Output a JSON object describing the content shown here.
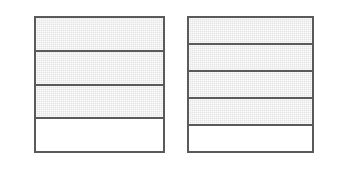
{
  "figure": {
    "background_color": "#ffffff",
    "border_color": "#5a5a5a",
    "shaded_color": "#e4e4e4",
    "unshaded_color": "#ffffff"
  },
  "models": [
    {
      "name": "left-fraction-model",
      "label": "3/4",
      "numerator": 3,
      "denominator": 4,
      "total_parts": 4,
      "shaded_parts": 3,
      "unshaded_parts": 1,
      "orientation": "horizontal-bands",
      "x": 34,
      "y": 16,
      "width": 131,
      "height": 137,
      "bands": [
        {
          "index": 1,
          "state": "shaded"
        },
        {
          "index": 2,
          "state": "shaded"
        },
        {
          "index": 3,
          "state": "shaded"
        },
        {
          "index": 4,
          "state": "unshaded"
        }
      ]
    },
    {
      "name": "right-fraction-model",
      "label": "4/5",
      "numerator": 4,
      "denominator": 5,
      "total_parts": 5,
      "shaded_parts": 4,
      "unshaded_parts": 1,
      "orientation": "horizontal-bands",
      "x": 187,
      "y": 16,
      "width": 127,
      "height": 137,
      "bands": [
        {
          "index": 1,
          "state": "shaded"
        },
        {
          "index": 2,
          "state": "shaded"
        },
        {
          "index": 3,
          "state": "shaded"
        },
        {
          "index": 4,
          "state": "shaded"
        },
        {
          "index": 5,
          "state": "unshaded"
        }
      ]
    }
  ]
}
